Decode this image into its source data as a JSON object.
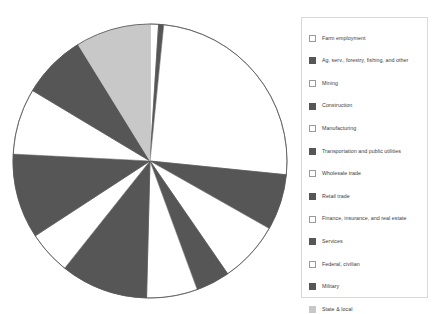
{
  "chart_data": {
    "type": "pie",
    "title": "",
    "subtitle": "",
    "xlabel": "",
    "ylabel": "",
    "grid": false,
    "legend_position": "right",
    "start_angle_deg": 0,
    "direction": "clockwise",
    "categories": [
      "Farm employment",
      "Ag. serv., forestry, fishing, and other",
      "Mining",
      "Construction",
      "Manufacturing",
      "Transportation and public utilities",
      "Wholesale trade",
      "Retail trade",
      "Finance, insurance, and real estate",
      "Services",
      "Federal, civilian",
      "Military",
      "State & local"
    ],
    "values": [
      1.0,
      0.6,
      25.0,
      6.6,
      7.2,
      4.0,
      6.0,
      10.3,
      5.1,
      10.0,
      7.8,
      7.6,
      8.8
    ],
    "slice_colors": [
      "#ffffff",
      "#565656",
      "#ffffff",
      "#565656",
      "#ffffff",
      "#565656",
      "#ffffff",
      "#565656",
      "#ffffff",
      "#565656",
      "#ffffff",
      "#565656",
      "#c8c8c8"
    ],
    "ylim": [
      0,
      100
    ]
  },
  "legend": {
    "items": [
      {
        "label": "Farm employment",
        "color": "#ffffff"
      },
      {
        "label": "Ag. serv., forestry, fishing, and other",
        "color": "#565656"
      },
      {
        "label": "Mining",
        "color": "#ffffff"
      },
      {
        "label": "Construction",
        "color": "#565656"
      },
      {
        "label": "Manufacturing",
        "color": "#ffffff"
      },
      {
        "label": "Transportation and public utilities",
        "color": "#565656"
      },
      {
        "label": "Wholesale trade",
        "color": "#ffffff"
      },
      {
        "label": "Retail trade",
        "color": "#565656"
      },
      {
        "label": "Finance, insurance, and real estate",
        "color": "#ffffff"
      },
      {
        "label": "Services",
        "color": "#565656"
      },
      {
        "label": "Federal, civilian",
        "color": "#ffffff"
      },
      {
        "label": "Military",
        "color": "#565656"
      },
      {
        "label": "State & local",
        "color": "#c8c8c8"
      }
    ]
  },
  "style": {
    "pie_outline": "#555555",
    "legend_border": "#d9d9d9",
    "text_color": "#3b3b3b",
    "background": "#ffffff"
  }
}
